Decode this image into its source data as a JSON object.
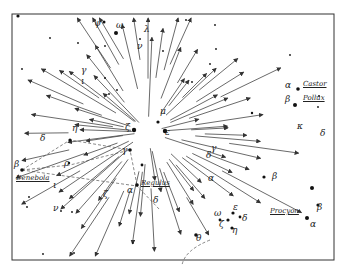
{
  "diagram": {
    "type": "meteor-radiant-star-chart",
    "frame": {
      "x": 12,
      "y": 14,
      "width": 322,
      "height": 246,
      "stroke": "#333333"
    },
    "radiant": {
      "x": 148,
      "y": 132
    },
    "colors": {
      "ink": "#333333",
      "background": "#ffffff"
    },
    "named_stars": [
      {
        "name": "Castor",
        "greek": "α",
        "x": 297,
        "y": 89
      },
      {
        "name": "Pollux",
        "greek": "β",
        "x": 297,
        "y": 103
      },
      {
        "name": "Denebola",
        "greek": "β",
        "x": 20,
        "y": 172
      },
      {
        "name": "Regulus",
        "greek": "α",
        "x": 135,
        "y": 185
      },
      {
        "name": "Procyon",
        "greek": "α",
        "x": 308,
        "y": 218
      }
    ],
    "greek_labels": [
      {
        "text": "ψ",
        "x": 94,
        "y": 25
      },
      {
        "text": "ω",
        "x": 116,
        "y": 27
      },
      {
        "text": "λ",
        "x": 144,
        "y": 31
      },
      {
        "text": "ν",
        "x": 137,
        "y": 48
      },
      {
        "text": "γ",
        "x": 81,
        "y": 72
      },
      {
        "text": "ι",
        "x": 81,
        "y": 83
      },
      {
        "text": "μ",
        "x": 160,
        "y": 113
      },
      {
        "text": "ζ",
        "x": 125,
        "y": 129
      },
      {
        "text": "ε",
        "x": 165,
        "y": 134
      },
      {
        "text": "γ",
        "x": 122,
        "y": 152
      },
      {
        "text": "η",
        "x": 72,
        "y": 130
      },
      {
        "text": "δ",
        "x": 40,
        "y": 140
      },
      {
        "text": "ρ",
        "x": 64,
        "y": 165
      },
      {
        "text": "ι",
        "x": 53,
        "y": 187
      },
      {
        "text": "ν",
        "x": 53,
        "y": 210
      },
      {
        "text": "ζ",
        "x": 103,
        "y": 196
      },
      {
        "text": "δ",
        "x": 153,
        "y": 202
      },
      {
        "text": "δ",
        "x": 206,
        "y": 157
      },
      {
        "text": "γ",
        "x": 211,
        "y": 150
      },
      {
        "text": "κ",
        "x": 297,
        "y": 128
      },
      {
        "text": "δ",
        "x": 320,
        "y": 135
      },
      {
        "text": "β",
        "x": 272,
        "y": 178
      },
      {
        "text": "α",
        "x": 208,
        "y": 180
      },
      {
        "text": "ε",
        "x": 233,
        "y": 209
      },
      {
        "text": "ω",
        "x": 214,
        "y": 215
      },
      {
        "text": "δ",
        "x": 242,
        "y": 220
      },
      {
        "text": "ζ",
        "x": 219,
        "y": 226
      },
      {
        "text": "η",
        "x": 232,
        "y": 232
      },
      {
        "text": "θ",
        "x": 196,
        "y": 240
      },
      {
        "text": "β",
        "x": 317,
        "y": 209
      }
    ]
  }
}
